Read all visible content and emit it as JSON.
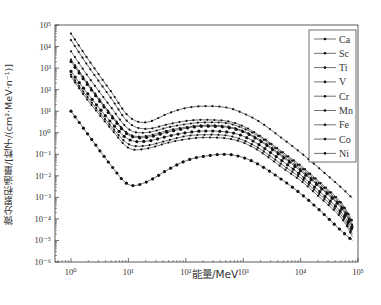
{
  "chart_data": {
    "type": "line",
    "title": "",
    "xlabel": "能量/MeV",
    "ylabel": "微分累积通量/[粒子/(cm²·MeV·n⁻¹)]",
    "xscale": "log",
    "yscale": "log",
    "xlim": [
      0.5,
      100000
    ],
    "ylim": [
      1e-06,
      100000
    ],
    "x_ticks": [
      "10⁰",
      "10¹",
      "10²",
      "10³",
      "10⁴",
      "10⁵"
    ],
    "y_ticks": [
      "10⁻⁶",
      "10⁻⁵",
      "10⁻⁴",
      "10⁻³",
      "10⁻²",
      "10⁻¹",
      "10⁰",
      "10¹",
      "10²",
      "10³",
      "10⁴",
      "10⁵"
    ],
    "grid": false,
    "legend_position": "upper right",
    "x": [
      1,
      2,
      5,
      10,
      20,
      50,
      100,
      200,
      500,
      1000,
      2000,
      5000,
      10000,
      20000,
      50000,
      80000
    ],
    "series": [
      {
        "name": "Ca",
        "values": [
          40000,
          2500,
          80,
          6,
          3,
          8,
          14,
          17,
          15,
          8,
          3,
          0.5,
          0.12,
          0.025,
          0.003,
          0.0009
        ]
      },
      {
        "name": "Sc",
        "values": [
          20000,
          1200,
          40,
          3,
          1.5,
          2.5,
          3.5,
          4,
          3.5,
          2,
          0.7,
          0.12,
          0.03,
          0.006,
          0.0006,
          8e-05
        ]
      },
      {
        "name": "Ti",
        "values": [
          6000,
          400,
          15,
          1.5,
          1,
          1.8,
          2.5,
          3,
          2.8,
          1.6,
          0.6,
          0.1,
          0.025,
          0.005,
          0.0005,
          6e-05
        ]
      },
      {
        "name": "V",
        "values": [
          2500,
          180,
          7,
          0.9,
          0.7,
          1.3,
          1.8,
          2.2,
          2,
          1.2,
          0.45,
          0.08,
          0.02,
          0.004,
          0.0004,
          5e-05
        ]
      },
      {
        "name": "Cr",
        "values": [
          2000,
          150,
          6,
          0.8,
          0.6,
          1.1,
          1.6,
          2,
          1.8,
          1.1,
          0.4,
          0.07,
          0.017,
          0.0035,
          0.00035,
          4e-05
        ]
      },
      {
        "name": "Mn",
        "values": [
          700,
          60,
          3,
          0.5,
          0.4,
          0.7,
          1,
          1.2,
          1.1,
          0.7,
          0.25,
          0.045,
          0.011,
          0.0022,
          0.00022,
          3e-05
        ]
      },
      {
        "name": "Fe",
        "values": [
          500,
          40,
          2,
          0.3,
          0.25,
          0.45,
          0.7,
          0.8,
          0.75,
          0.45,
          0.17,
          0.03,
          0.008,
          0.0016,
          0.00016,
          2e-05
        ]
      },
      {
        "name": "Co",
        "values": [
          10,
          0.8,
          0.03,
          0.004,
          0.005,
          0.02,
          0.05,
          0.08,
          0.1,
          0.07,
          0.03,
          0.006,
          0.0015,
          0.0003,
          3e-05,
          1e-05
        ]
      },
      {
        "name": "Ni",
        "values": [
          400,
          30,
          1.5,
          0.2,
          0.18,
          0.35,
          0.5,
          0.6,
          0.55,
          0.35,
          0.13,
          0.022,
          0.006,
          0.0012,
          0.00012,
          1.5e-05
        ]
      }
    ]
  },
  "colors": {
    "line": "#333333",
    "marker": "#111111",
    "axis": "#333333"
  }
}
